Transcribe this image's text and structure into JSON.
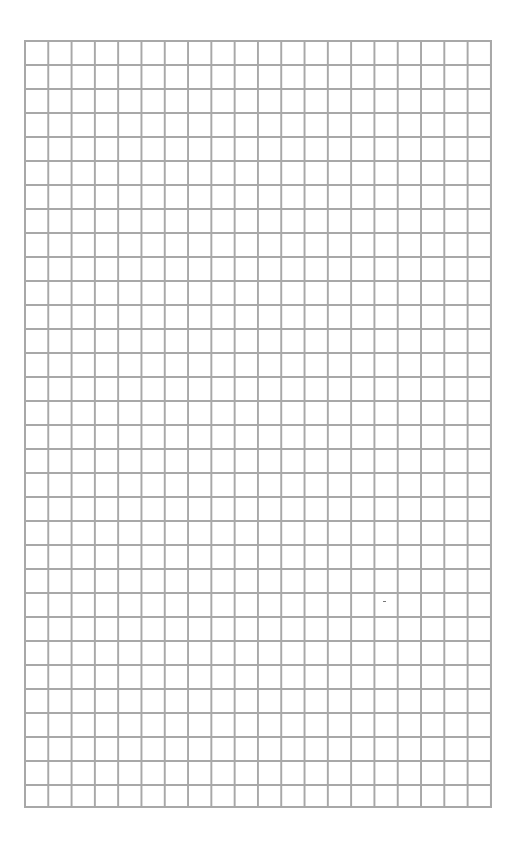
{
  "page": {
    "type": "graph-paper",
    "background_color": "#ffffff"
  },
  "grid": {
    "columns": 20,
    "rows": 32,
    "line_color": "#a8a8a8",
    "cell_width_px": 23.3,
    "cell_height_px": 24
  }
}
